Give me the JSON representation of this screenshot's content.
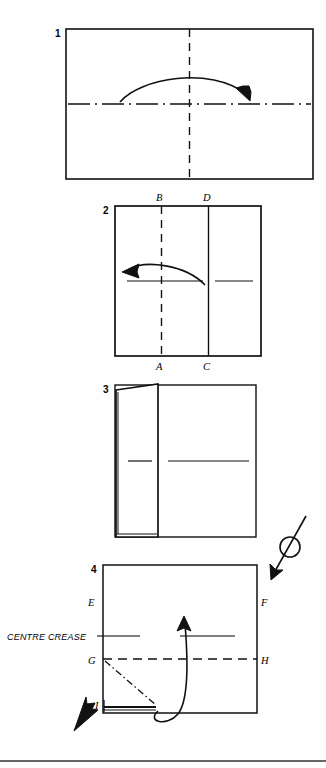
{
  "document": {
    "type": "origami-folding-instructions",
    "background_color": "#fefefe",
    "ink_color": "#111111"
  },
  "steps": [
    {
      "number": "1",
      "name": "step-1",
      "shape": "horizontal rectangle",
      "creases": [
        "vertical dashed centre line",
        "horizontal dash-dot centre line"
      ],
      "arrow": "curved arrow pointing right"
    },
    {
      "number": "2",
      "name": "step-2",
      "shape": "square with vertical fold line at right",
      "creases": [
        "vertical dashed centre line",
        "horizontal solid line"
      ],
      "arrow": "curved arrow pointing left",
      "corner_labels": [
        "B",
        "D",
        "A",
        "C"
      ]
    },
    {
      "number": "3",
      "name": "step-3",
      "shape": "square with folded flap on left edge",
      "creases": [
        "horizontal centre line"
      ]
    },
    {
      "number": "4",
      "name": "step-4",
      "shape": "square with bottom flap",
      "creases": [
        "horizontal centre crease",
        "horizontal dashed line G-H",
        "dash-dot diagonal fold"
      ],
      "arrow": "curved arrow sweeping up",
      "corner_labels": [
        "E",
        "F",
        "G",
        "H",
        "I"
      ]
    }
  ],
  "labels": {
    "step1_number": "1",
    "step2_number": "2",
    "step3_number": "3",
    "step4_number": "4",
    "B": "B",
    "D": "D",
    "A": "A",
    "C": "C",
    "E": "E",
    "F": "F",
    "G": "G",
    "H": "H",
    "I": "I",
    "centre_crease": "CENTRE CREASE"
  },
  "symbols": {
    "turn_over": "turn-over-loop-arrow"
  },
  "colors": {
    "ink": "#111111",
    "paper": "#ffffff",
    "rule": "#333333"
  }
}
